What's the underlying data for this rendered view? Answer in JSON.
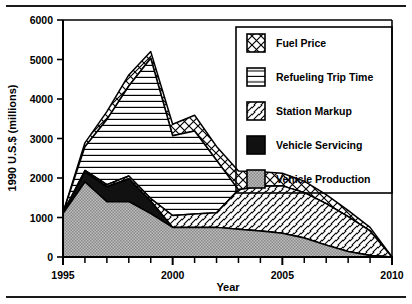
{
  "chart_data": {
    "type": "area",
    "stacked": true,
    "title": "",
    "xlabel": "Year",
    "ylabel": "1990 U.S.$ (millions)",
    "xlim": [
      1995,
      2010
    ],
    "ylim": [
      0,
      6000
    ],
    "x_ticks": [
      1995,
      2000,
      2005,
      2010
    ],
    "x_tick_labels": [
      "1995",
      "2000",
      "2005",
      "2010"
    ],
    "x_minor_tick_step": 1,
    "y_ticks": [
      0,
      1000,
      2000,
      3000,
      4000,
      5000,
      6000
    ],
    "y_tick_labels": [
      "0",
      "1000",
      "2000",
      "3000",
      "4000",
      "5000",
      "6000"
    ],
    "grid": false,
    "legend_position": "upper right inside",
    "x": [
      1995,
      1996,
      1997,
      1998,
      1999,
      2000,
      2001,
      2002,
      2003,
      2004,
      2005,
      2006,
      2007,
      2008,
      2009,
      2010
    ],
    "series": [
      {
        "name": "Vehicle Production",
        "pattern": "solid-grey",
        "values": [
          1100,
          1900,
          1400,
          1400,
          1100,
          750,
          750,
          750,
          700,
          660,
          600,
          480,
          300,
          140,
          40,
          0
        ]
      },
      {
        "name": "Vehicle Servicing",
        "pattern": "solid-black",
        "values": [
          0,
          250,
          380,
          580,
          320,
          0,
          0,
          0,
          0,
          0,
          0,
          0,
          0,
          0,
          0,
          0
        ]
      },
      {
        "name": "Station Markup",
        "pattern": "diagonal-hatch",
        "values": [
          20,
          40,
          50,
          70,
          60,
          300,
          340,
          370,
          1000,
          1130,
          1200,
          1150,
          1050,
          880,
          620,
          0
        ]
      },
      {
        "name": "Refueling Trip Time",
        "pattern": "horizontal-hatch",
        "values": [
          0,
          600,
          1650,
          2280,
          3550,
          2020,
          2100,
          1330,
          0,
          0,
          0,
          0,
          0,
          0,
          0,
          0
        ]
      },
      {
        "name": "Fuel Price",
        "pattern": "crosshatch",
        "values": [
          0,
          100,
          200,
          280,
          170,
          290,
          400,
          350,
          480,
          370,
          320,
          290,
          230,
          160,
          90,
          0
        ]
      }
    ],
    "totals": [
      1120,
      2890,
      3680,
      4610,
      5200,
      3360,
      3590,
      2800,
      2180,
      2160,
      2120,
      1920,
      1580,
      1180,
      750,
      0
    ]
  },
  "legend": {
    "items": [
      {
        "label": "Fuel Price",
        "pattern": "crosshatch"
      },
      {
        "label": "Refueling Trip Time",
        "pattern": "horizontal-hatch"
      },
      {
        "label": "Station Markup",
        "pattern": "diagonal-hatch"
      },
      {
        "label": "Vehicle Servicing",
        "pattern": "solid-black"
      },
      {
        "label": "Vehicle Production",
        "pattern": "solid-grey"
      }
    ]
  },
  "colors": {
    "ink": "#000000",
    "grey_fill": "#a8a8a8",
    "black_fill": "#111111",
    "white_fill": "#ffffff",
    "page_rule": "#1a1a1a"
  }
}
